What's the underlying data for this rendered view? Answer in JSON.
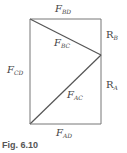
{
  "figure": {
    "caption": "Fig. 6.10",
    "labels": {
      "f_bd": {
        "main": "F",
        "sub": "BD"
      },
      "r_b": {
        "main": "R",
        "sub": "B"
      },
      "f_bc": {
        "main": "F",
        "sub": "BC"
      },
      "f_cd": {
        "main": "F",
        "sub": "CD"
      },
      "r_a": {
        "main": "R",
        "sub": "A"
      },
      "f_ac": {
        "main": "F",
        "sub": "AC"
      },
      "f_ad": {
        "main": "F",
        "sub": "AD"
      }
    },
    "colors": {
      "line": "#666666",
      "text": "#444444"
    }
  }
}
